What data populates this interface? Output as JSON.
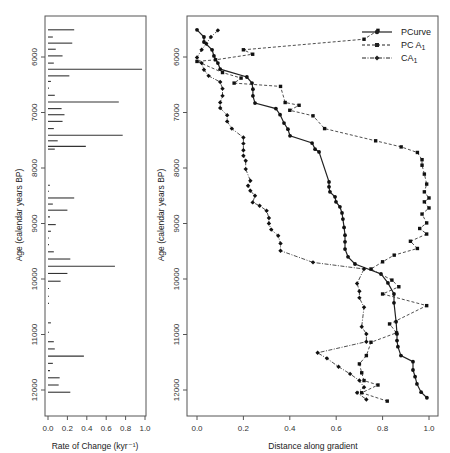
{
  "chart_data": [
    {
      "type": "bar",
      "orientation": "horizontal",
      "panel": "left",
      "title": "",
      "xlabel": "Rate of Change (kyr⁻¹)",
      "ylabel": "Age (calendar years BP)",
      "xlim": [
        0.0,
        1.0
      ],
      "ylim": [
        12500,
        5400
      ],
      "xticks": [
        "0.0",
        "0.2",
        "0.4",
        "0.6",
        "0.8",
        "1.0"
      ],
      "yticks": [
        "6000",
        "7000",
        "8000",
        "9000",
        "10000",
        "11000",
        "12000"
      ],
      "grid": false,
      "ages": [
        5510,
        5640,
        5750,
        5860,
        5980,
        6110,
        6220,
        6340,
        6440,
        6560,
        6690,
        6810,
        6930,
        7040,
        7160,
        7290,
        7410,
        7510,
        7610,
        7660,
        8310,
        8420,
        8540,
        8650,
        8760,
        8880,
        9020,
        9140,
        9260,
        9380,
        9510,
        9640,
        9770,
        9900,
        10040,
        10170,
        10310,
        10440,
        10790,
        10960,
        11130,
        11260,
        11390,
        11520,
        11650,
        11780,
        11910,
        12040
      ],
      "values": [
        0.27,
        0.05,
        0.25,
        0.08,
        0.15,
        0.06,
        0.97,
        0.22,
        0.03,
        0.01,
        0.07,
        0.73,
        0.14,
        0.17,
        0.15,
        0.06,
        0.77,
        0.1,
        0.39,
        0.07,
        0.02,
        0.01,
        0.27,
        0.05,
        0.2,
        0.02,
        0.08,
        0.03,
        0.01,
        0.01,
        0.06,
        0.23,
        0.69,
        0.2,
        0.13,
        0.01,
        0.01,
        0.01,
        0.03,
        0.01,
        0.06,
        0.07,
        0.37,
        0.05,
        0.02,
        0.12,
        0.11,
        0.23
      ]
    },
    {
      "type": "line",
      "panel": "right",
      "title": "",
      "xlabel": "Distance along gradient",
      "ylabel": "Age (calendar years BP)",
      "xlim": [
        0.0,
        1.0
      ],
      "ylim": [
        12500,
        5400
      ],
      "xticks": [
        "0.0",
        "0.2",
        "0.4",
        "0.6",
        "0.8",
        "1.0"
      ],
      "yticks": [
        "6000",
        "7000",
        "8000",
        "9000",
        "10000",
        "11000",
        "12000"
      ],
      "grid": false,
      "legend_position": "top-right",
      "series": [
        {
          "name": "PCurve",
          "style": "solid",
          "marker": "circle",
          "points": [
            [
              0.0,
              5510
            ],
            [
              0.03,
              5640
            ],
            [
              0.03,
              5730
            ],
            [
              0.065,
              5870
            ],
            [
              0.073,
              5980
            ],
            [
              0.09,
              6110
            ],
            [
              0.1,
              6220
            ],
            [
              0.215,
              6360
            ],
            [
              0.237,
              6470
            ],
            [
              0.241,
              6580
            ],
            [
              0.241,
              6700
            ],
            [
              0.25,
              6830
            ],
            [
              0.34,
              6930
            ],
            [
              0.358,
              7040
            ],
            [
              0.375,
              7190
            ],
            [
              0.392,
              7300
            ],
            [
              0.401,
              7420
            ],
            [
              0.496,
              7550
            ],
            [
              0.509,
              7660
            ],
            [
              0.526,
              7710
            ],
            [
              0.569,
              8250
            ],
            [
              0.569,
              8340
            ],
            [
              0.573,
              8430
            ],
            [
              0.595,
              8520
            ],
            [
              0.599,
              8610
            ],
            [
              0.616,
              8700
            ],
            [
              0.625,
              8810
            ],
            [
              0.629,
              8920
            ],
            [
              0.634,
              9070
            ],
            [
              0.638,
              9210
            ],
            [
              0.638,
              9330
            ],
            [
              0.638,
              9460
            ],
            [
              0.651,
              9600
            ],
            [
              0.681,
              9730
            ],
            [
              0.793,
              9910
            ],
            [
              0.823,
              10070
            ],
            [
              0.849,
              10270
            ],
            [
              0.849,
              10430
            ],
            [
              0.858,
              10770
            ],
            [
              0.862,
              10990
            ],
            [
              0.862,
              11110
            ],
            [
              0.866,
              11220
            ],
            [
              0.879,
              11380
            ],
            [
              0.931,
              11490
            ],
            [
              0.931,
              11640
            ],
            [
              0.94,
              11760
            ],
            [
              0.948,
              11890
            ],
            [
              0.966,
              12040
            ],
            [
              0.991,
              12140
            ]
          ]
        },
        {
          "name": "PC A₁",
          "style": "dashed",
          "marker": "square",
          "points": [
            [
              0.78,
              5520
            ],
            [
              0.72,
              5680
            ],
            [
              0.2,
              5870
            ],
            [
              0.24,
              5950
            ],
            [
              0.08,
              6050
            ],
            [
              0.0,
              6080
            ],
            [
              0.11,
              6280
            ],
            [
              0.19,
              6380
            ],
            [
              0.16,
              6470
            ],
            [
              0.36,
              6530
            ],
            [
              0.38,
              6820
            ],
            [
              0.44,
              6870
            ],
            [
              0.4,
              6960
            ],
            [
              0.5,
              7060
            ],
            [
              0.55,
              7290
            ],
            [
              0.77,
              7510
            ],
            [
              0.88,
              7620
            ],
            [
              0.95,
              7720
            ],
            [
              0.97,
              7850
            ],
            [
              0.97,
              7950
            ],
            [
              0.98,
              8110
            ],
            [
              0.99,
              8290
            ],
            [
              0.98,
              8430
            ],
            [
              1.0,
              8540
            ],
            [
              0.98,
              8610
            ],
            [
              1.0,
              8720
            ],
            [
              0.97,
              8830
            ],
            [
              0.99,
              8990
            ],
            [
              0.96,
              9090
            ],
            [
              0.99,
              9190
            ],
            [
              0.92,
              9320
            ],
            [
              0.95,
              9450
            ],
            [
              0.85,
              9570
            ],
            [
              0.8,
              9690
            ],
            [
              0.75,
              9820
            ],
            [
              0.84,
              10020
            ],
            [
              0.87,
              10140
            ],
            [
              0.8,
              10270
            ],
            [
              0.99,
              10480
            ],
            [
              0.83,
              10810
            ],
            [
              0.86,
              10970
            ],
            [
              0.75,
              11140
            ],
            [
              0.73,
              11380
            ],
            [
              0.7,
              11530
            ],
            [
              0.71,
              11690
            ],
            [
              0.72,
              11830
            ],
            [
              0.78,
              11910
            ],
            [
              0.71,
              12050
            ],
            [
              0.82,
              12200
            ]
          ]
        },
        {
          "name": "CA₁",
          "style": "dotdash",
          "marker": "diamond",
          "points": [
            [
              0.09,
              5520
            ],
            [
              0.06,
              5640
            ],
            [
              0.04,
              5760
            ],
            [
              0.02,
              5870
            ],
            [
              0.0,
              6010
            ],
            [
              0.02,
              6110
            ],
            [
              0.03,
              6230
            ],
            [
              0.05,
              6340
            ],
            [
              0.1,
              6450
            ],
            [
              0.11,
              6570
            ],
            [
              0.11,
              6700
            ],
            [
              0.1,
              6820
            ],
            [
              0.1,
              6920
            ],
            [
              0.13,
              7050
            ],
            [
              0.13,
              7160
            ],
            [
              0.15,
              7290
            ],
            [
              0.2,
              7450
            ],
            [
              0.2,
              7560
            ],
            [
              0.2,
              7680
            ],
            [
              0.2,
              7780
            ],
            [
              0.21,
              7870
            ],
            [
              0.21,
              8020
            ],
            [
              0.23,
              8230
            ],
            [
              0.22,
              8320
            ],
            [
              0.23,
              8410
            ],
            [
              0.25,
              8500
            ],
            [
              0.24,
              8620
            ],
            [
              0.27,
              8680
            ],
            [
              0.3,
              8770
            ],
            [
              0.31,
              8900
            ],
            [
              0.31,
              9000
            ],
            [
              0.32,
              9110
            ],
            [
              0.35,
              9220
            ],
            [
              0.36,
              9360
            ],
            [
              0.36,
              9490
            ],
            [
              0.5,
              9700
            ],
            [
              0.72,
              9820
            ],
            [
              0.69,
              10080
            ],
            [
              0.7,
              10220
            ],
            [
              0.7,
              10340
            ],
            [
              0.72,
              10510
            ],
            [
              0.71,
              10860
            ],
            [
              0.73,
              10990
            ],
            [
              0.73,
              11130
            ],
            [
              0.52,
              11330
            ],
            [
              0.56,
              11430
            ],
            [
              0.61,
              11580
            ],
            [
              0.66,
              11710
            ],
            [
              0.7,
              11830
            ],
            [
              0.72,
              11950
            ],
            [
              0.69,
              12050
            ],
            [
              0.73,
              12170
            ]
          ]
        }
      ]
    }
  ],
  "left_panel": {
    "xlabel": "Rate of Change (kyr⁻¹)",
    "ylabel": "Age (calendar years BP)"
  },
  "right_panel": {
    "xlabel": "Distance along gradient",
    "ylabel": "Age (calendar years BP)",
    "legend": [
      {
        "label": "PCurve",
        "style": "solid"
      },
      {
        "label": "PC A",
        "sub": "1",
        "style": "dashed"
      },
      {
        "label": "CA",
        "sub": "1",
        "style": "dotdash"
      }
    ]
  },
  "colors": {
    "ink": "#222222",
    "axis": "#555555",
    "background": "#ffffff"
  }
}
